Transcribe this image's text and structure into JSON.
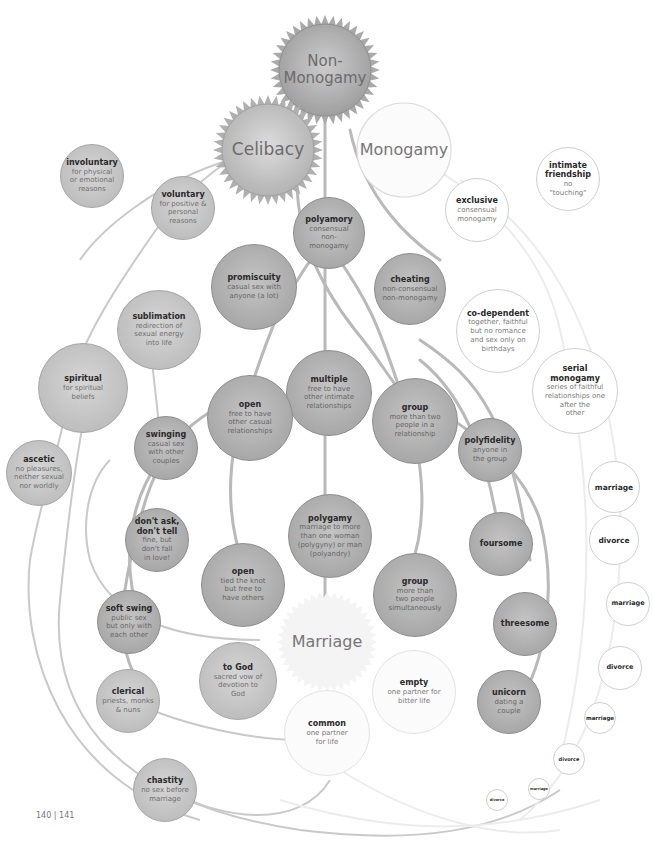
{
  "diagram": {
    "type": "tree / bubble diagram",
    "hubs": {
      "non_monogamy": "Non-\nMonogamy",
      "celibacy": "Celibacy",
      "monogamy": "Monogamy",
      "marriage": "Marriage"
    },
    "celibacy_branch": [
      {
        "title": "involuntary",
        "desc": "for physical\nor emotional\nreasons"
      },
      {
        "title": "voluntary",
        "desc": "for positive &\npersonal\nreasons"
      },
      {
        "title": "sublimation",
        "desc": "redirection of\nsexual energy\ninto life"
      },
      {
        "title": "spiritual",
        "desc": "for spiritual\nbeliefs"
      },
      {
        "title": "ascetic",
        "desc": "no pleasures,\nneither sexual\nnor worldly"
      },
      {
        "title": "clerical",
        "desc": "priests, monks\n& nuns"
      },
      {
        "title": "to God",
        "desc": "sacred vow of\ndevotion to\nGod"
      },
      {
        "title": "chastity",
        "desc": "no sex before\nmarriage"
      }
    ],
    "non_monogamy_branch": [
      {
        "title": "polyamory",
        "desc": "consensual\nnon-\nmonogamy"
      },
      {
        "title": "promiscuity",
        "desc": "casual sex with\nanyone (a lot)"
      },
      {
        "title": "cheating",
        "desc": "non-consensual\nnon-monogamy"
      },
      {
        "title": "multiple",
        "desc": "free to have\nother intimate\nrelationships"
      },
      {
        "title": "open",
        "desc": "free to have\nother casual\nrelationships"
      },
      {
        "title": "group",
        "desc": "more than two\npeople in a\nrelationship"
      },
      {
        "title": "swinging",
        "desc": "casual sex\nwith other\ncouples"
      },
      {
        "title": "polyfidelity",
        "desc": "anyone in\nthe group"
      },
      {
        "title": "polygamy",
        "desc": "marriage to more\nthan one woman\n(polygyny) or man\n(polyandry)"
      },
      {
        "title": "don't ask,\ndon't tell",
        "desc": "fine, but\ndon't fall\nin love!"
      },
      {
        "title": "open",
        "desc": "tied the knot\nbut free to\nhave others"
      },
      {
        "title": "group",
        "desc": "more than\ntwo people\nsimultaneously"
      },
      {
        "title": "soft swing",
        "desc": "public sex\nbut only with\neach other"
      },
      {
        "title": "foursome",
        "desc": ""
      },
      {
        "title": "threesome",
        "desc": ""
      },
      {
        "title": "unicorn",
        "desc": "dating a\ncouple"
      }
    ],
    "monogamy_branch": [
      {
        "title": "exclusive",
        "desc": "consensual\nmonogamy"
      },
      {
        "title": "intimate\nfriendship",
        "desc": "no\n\"touching\""
      },
      {
        "title": "co-dependent",
        "desc": "together, faithful\nbut no romance\nand sex only on\nbirthdays"
      },
      {
        "title": "serial\nmonogamy",
        "desc": "series of faithful\nrelationships one\nafter the\nother"
      },
      {
        "title": "empty",
        "desc": "one partner for\nbitter life"
      },
      {
        "title": "common",
        "desc": "one partner\nfor life"
      }
    ],
    "serial_chain": [
      "marriage",
      "divorce",
      "marriage",
      "divorce",
      "marriage",
      "divorce",
      "divorce",
      "marriage",
      "divorce"
    ],
    "page_number": "140 | 141"
  }
}
